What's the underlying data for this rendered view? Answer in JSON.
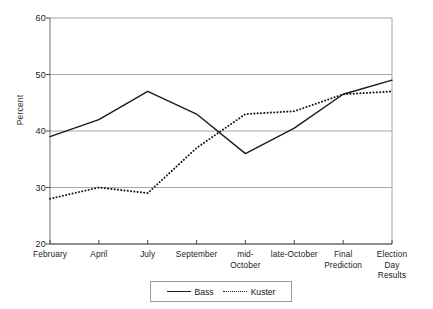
{
  "chart_data": {
    "type": "line",
    "title": "",
    "xlabel": "",
    "ylabel": "Percent",
    "ylim": [
      20,
      60
    ],
    "yticks": [
      20,
      30,
      40,
      50,
      60
    ],
    "grid": true,
    "legend_position": "bottom-center",
    "categories": [
      "February",
      "April",
      "July",
      "September",
      "mid-\nOctober",
      "late-October",
      "Final\nPrediction",
      "Election\nDay Results"
    ],
    "series": [
      {
        "name": "Bass",
        "style": "solid",
        "color": "#1a1a1a",
        "values": [
          39,
          42,
          47,
          43,
          36,
          40.5,
          46.5,
          49
        ]
      },
      {
        "name": "Kuster",
        "style": "dotted",
        "color": "#1a1a1a",
        "values": [
          28,
          30,
          29,
          37,
          43,
          43.5,
          46.5,
          47
        ]
      }
    ]
  },
  "legend": {
    "bass_label": "Bass",
    "kuster_label": "Kuster"
  }
}
